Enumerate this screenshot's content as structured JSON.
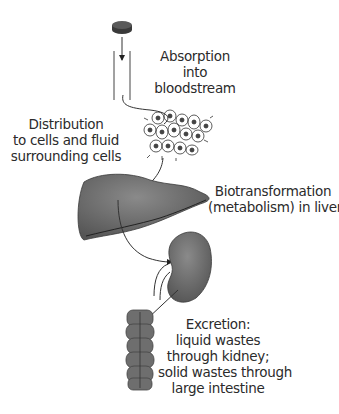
{
  "diagram": {
    "type": "pharmacokinetics-flow",
    "stages": [
      {
        "id": "absorption",
        "icon": "pill-icon",
        "lines": [
          "Absorption",
          "into",
          "bloodstream"
        ]
      },
      {
        "id": "distribution",
        "icon": "cells-icon",
        "lines": [
          "Distribution",
          "to cells and fluid",
          "surrounding cells"
        ]
      },
      {
        "id": "biotransformation",
        "icon": "liver-icon",
        "lines": [
          "Biotransformation",
          "(metabolism) in liver"
        ]
      },
      {
        "id": "excretion",
        "icon": "kidney-icon",
        "lines": [
          "Excretion:",
          "liquid wastes",
          "through kidney;",
          "solid wastes through",
          "large intestine"
        ]
      }
    ],
    "colors": {
      "organ": "#6b6b6b",
      "organ_dark": "#4a4a4a",
      "line": "#333333",
      "background": "#ffffff"
    }
  }
}
